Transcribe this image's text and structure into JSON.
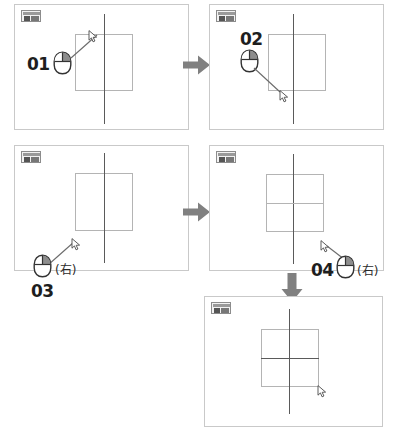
{
  "document": {
    "title": "Mouse operation step sequence",
    "background_color": "#ffffff",
    "step_count": 5
  },
  "palette": {
    "panel_border": "#c9c9c9",
    "line_active": "#5a5a5a",
    "line_soft": "#b4b4b4",
    "arrow_gray": "#808080",
    "label_dark": "#1e1e1e",
    "badge_border": "#8c8c8c",
    "badge_fill": "#f2f2f2"
  },
  "steps": [
    {
      "id": "step-01",
      "number": "01",
      "button": "left",
      "button_note": "",
      "badge_name": "tool-badge-icon",
      "cursor_name": "arrow-cursor",
      "description": "Left click at upper-left of rectangle"
    },
    {
      "id": "step-02",
      "number": "02",
      "button": "left",
      "button_note": "",
      "badge_name": "tool-badge-icon",
      "cursor_name": "arrow-cursor",
      "description": "Left click at lower area to finish vertical line"
    },
    {
      "id": "step-03",
      "number": "03",
      "button": "right",
      "button_note": "(右)",
      "badge_name": "tool-badge-icon",
      "cursor_name": "arrow-cursor",
      "description": "Right click at lower-left corner of rectangle"
    },
    {
      "id": "step-04",
      "number": "04",
      "button": "right",
      "button_note": "(右)",
      "badge_name": "tool-badge-icon",
      "cursor_name": "arrow-cursor",
      "description": "Right click at lower-right corner of rectangle"
    },
    {
      "id": "step-05",
      "number": "",
      "button": "none",
      "button_note": "",
      "badge_name": "tool-badge-icon",
      "cursor_name": "arrow-cursor",
      "description": "Result: vertical and horizontal lines drawn through rectangle"
    }
  ],
  "flow": [
    {
      "id": "arrow-1-to-2",
      "direction": "right",
      "name": "flow-arrow-right-top"
    },
    {
      "id": "arrow-3-to-4",
      "direction": "right",
      "name": "flow-arrow-right-bottom"
    },
    {
      "id": "arrow-4-to-5",
      "direction": "down",
      "name": "flow-arrow-down"
    }
  ]
}
